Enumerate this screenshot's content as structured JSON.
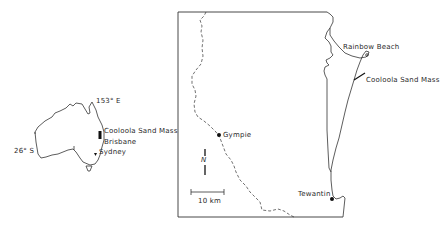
{
  "inset": {
    "longitude_label": "153° E",
    "latitude_label": "26° S",
    "places": [
      {
        "name": "Cooloola Sand Mass"
      },
      {
        "name": "Brisbane"
      },
      {
        "name": "Sydney"
      }
    ]
  },
  "main_map": {
    "places": [
      {
        "name": "Rainbow Beach"
      },
      {
        "name": "Cooloola Sand Mass"
      },
      {
        "name": "Gympie"
      },
      {
        "name": "Tewantin"
      }
    ],
    "scale_bar": {
      "label": "10 km"
    },
    "north_arrow": {
      "label": "N"
    }
  },
  "colors": {
    "ink": "#222222",
    "background": "#ffffff"
  }
}
